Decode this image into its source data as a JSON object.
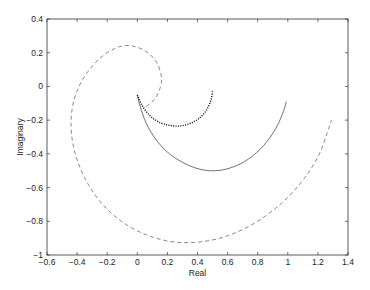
{
  "chart_data": {
    "type": "line",
    "title": "",
    "xlabel": "Real",
    "ylabel": "Imaginary",
    "xlim": [
      -0.6,
      1.4
    ],
    "ylim": [
      -1,
      0.4
    ],
    "xticks": [
      -0.6,
      -0.4,
      -0.2,
      0,
      0.2,
      0.4,
      0.6,
      0.8,
      1,
      1.2,
      1.4
    ],
    "xtick_labels": [
      "-0.6",
      "-0.4",
      "-0.2",
      "0",
      "0.2",
      "0.4",
      "0.6",
      "0.8",
      "1",
      "1.2",
      "1.4"
    ],
    "yticks": [
      0.4,
      0.2,
      0,
      -0.2,
      -0.4,
      -0.6,
      -0.8,
      -1
    ],
    "ytick_labels": [
      "0.4",
      "0.2",
      "0",
      "-0.2",
      "-0.4",
      "-0.6",
      "-0.8",
      "-1"
    ],
    "grid": false,
    "legend": null,
    "series": [
      {
        "name": "solid",
        "style": "solid",
        "color": "#000000",
        "points": [
          [
            0.0,
            -0.05
          ],
          [
            0.02,
            -0.12
          ],
          [
            0.06,
            -0.22
          ],
          [
            0.12,
            -0.31
          ],
          [
            0.2,
            -0.39
          ],
          [
            0.3,
            -0.45
          ],
          [
            0.41,
            -0.49
          ],
          [
            0.52,
            -0.5
          ],
          [
            0.63,
            -0.48
          ],
          [
            0.74,
            -0.43
          ],
          [
            0.84,
            -0.35
          ],
          [
            0.92,
            -0.25
          ],
          [
            0.97,
            -0.15
          ],
          [
            0.99,
            -0.09
          ]
        ]
      },
      {
        "name": "dotted",
        "style": "dotted",
        "color": "#000000",
        "points": [
          [
            0.0,
            -0.05
          ],
          [
            0.03,
            -0.11
          ],
          [
            0.08,
            -0.17
          ],
          [
            0.14,
            -0.21
          ],
          [
            0.21,
            -0.23
          ],
          [
            0.28,
            -0.235
          ],
          [
            0.35,
            -0.22
          ],
          [
            0.41,
            -0.19
          ],
          [
            0.46,
            -0.14
          ],
          [
            0.49,
            -0.08
          ],
          [
            0.5,
            -0.03
          ]
        ]
      },
      {
        "name": "dashed",
        "style": "dashed",
        "color": "#000000",
        "points": [
          [
            0.06,
            -0.12
          ],
          [
            0.12,
            -0.07
          ],
          [
            0.155,
            0.0
          ],
          [
            0.16,
            0.06
          ],
          [
            0.13,
            0.14
          ],
          [
            0.07,
            0.2
          ],
          [
            -0.01,
            0.235
          ],
          [
            -0.1,
            0.24
          ],
          [
            -0.2,
            0.2
          ],
          [
            -0.29,
            0.13
          ],
          [
            -0.37,
            0.03
          ],
          [
            -0.42,
            -0.08
          ],
          [
            -0.44,
            -0.2
          ],
          [
            -0.43,
            -0.33
          ],
          [
            -0.39,
            -0.46
          ],
          [
            -0.32,
            -0.59
          ],
          [
            -0.22,
            -0.71
          ],
          [
            -0.09,
            -0.81
          ],
          [
            0.06,
            -0.88
          ],
          [
            0.22,
            -0.92
          ],
          [
            0.38,
            -0.925
          ],
          [
            0.55,
            -0.9
          ],
          [
            0.72,
            -0.84
          ],
          [
            0.88,
            -0.75
          ],
          [
            1.02,
            -0.64
          ],
          [
            1.13,
            -0.52
          ],
          [
            1.21,
            -0.4
          ],
          [
            1.26,
            -0.28
          ],
          [
            1.29,
            -0.2
          ]
        ]
      }
    ]
  },
  "layout": {
    "plot_left": 47,
    "plot_top": 19,
    "plot_right": 348,
    "plot_bottom": 255
  }
}
